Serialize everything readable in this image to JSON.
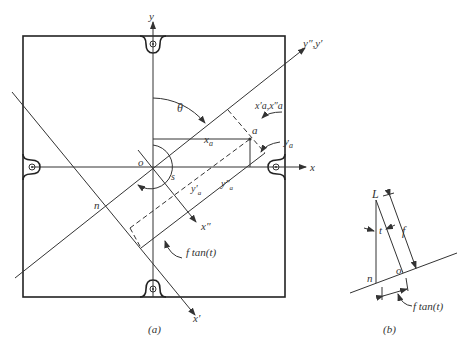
{
  "figure_a": {
    "caption": "(a)",
    "labels": {
      "y": "y",
      "x": "x",
      "y_double_prime_y_prime": "y″,y′",
      "x_prime": "x′",
      "x_double_prime": "x″",
      "theta": "θ",
      "o": "o",
      "s": "s",
      "n": "n",
      "a": "a",
      "x_a": "x",
      "x_a_sub": "a",
      "y_a": "y",
      "y_a_sub": "a",
      "xa_prime_xa_dprime": "x′a,x″a",
      "y_a_prime": "y′",
      "y_a_prime_sub": "a",
      "y_a_dprime": "y″",
      "y_a_dprime_sub": "a",
      "f_tan_t": "f tan(t)"
    }
  },
  "figure_b": {
    "caption": "(b)",
    "labels": {
      "L": "L",
      "t": "t",
      "f": "f",
      "n": "n",
      "o": "o",
      "f_tan_t": "f tan(t)"
    }
  }
}
